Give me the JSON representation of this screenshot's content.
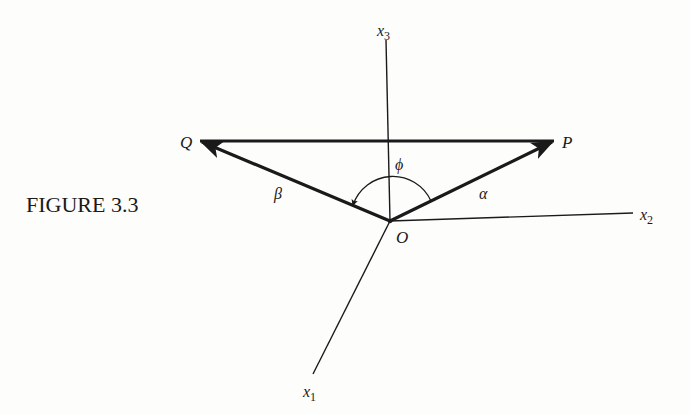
{
  "figure": {
    "caption": "FIGURE 3.3",
    "axes": [
      {
        "id": "x1",
        "label": "x",
        "subscript": "1"
      },
      {
        "id": "x2",
        "label": "x",
        "subscript": "2"
      },
      {
        "id": "x3",
        "label": "x",
        "subscript": "3"
      }
    ],
    "points": {
      "origin": "O",
      "p": "P",
      "q": "Q"
    },
    "vectors": {
      "alpha": "α",
      "beta": "β"
    },
    "angle": "ϕ",
    "colors": {
      "ink": "#1a1a1a",
      "paper": "#fdfdfc"
    }
  }
}
